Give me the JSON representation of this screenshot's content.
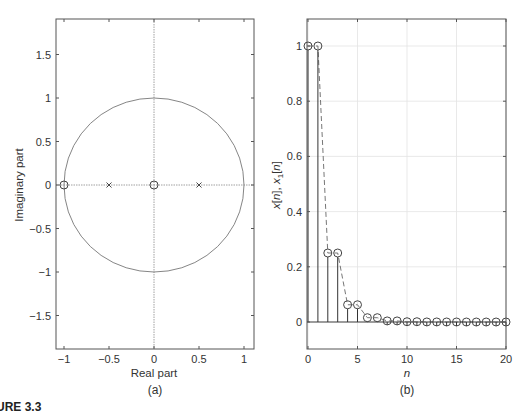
{
  "figure_caption": "URE 3.3",
  "chart_data": [
    {
      "type": "scatter",
      "panel": "(a)",
      "title": "",
      "xlabel": "Real part",
      "ylabel": "Imaginary part",
      "xlim": [
        -1.1,
        1.1
      ],
      "ylim": [
        -1.9,
        1.9
      ],
      "xticks": [
        "-1",
        "-0.5",
        "0",
        "0.5",
        "1"
      ],
      "yticks": [
        "-1.5",
        "-1",
        "-0.5",
        "0",
        "0.5",
        "1",
        "1.5"
      ],
      "grid": false,
      "unit_circle": true,
      "zeros": [
        {
          "re": -1,
          "im": 0
        },
        {
          "re": 0,
          "im": 0
        }
      ],
      "poles": [
        {
          "re": -0.5,
          "im": 0
        },
        {
          "re": 0.5,
          "im": 0
        }
      ],
      "legend": []
    },
    {
      "type": "stem",
      "panel": "(b)",
      "title": "",
      "xlabel": "n",
      "ylabel": "x[n], x1[n]",
      "xlim": [
        0,
        20
      ],
      "ylim": [
        -0.1,
        1.1
      ],
      "xticks": [
        "0",
        "5",
        "10",
        "15",
        "20"
      ],
      "yticks": [
        "0",
        "0.2",
        "0.4",
        "0.6",
        "0.8",
        "1"
      ],
      "grid": true,
      "x": [
        0,
        1,
        2,
        3,
        4,
        5,
        6,
        7,
        8,
        9,
        10,
        11,
        12,
        13,
        14,
        15,
        16,
        17,
        18,
        19,
        20
      ],
      "series": [
        {
          "name": "x[n] (stem)",
          "values": [
            1,
            1,
            0.25,
            0.25,
            0.0625,
            0.0625,
            0.0156,
            0.0156,
            0.0039,
            0.0039,
            0.001,
            0.001,
            0.0002,
            0.0002,
            0.0001,
            0.0001,
            0,
            0,
            0,
            0,
            0
          ]
        },
        {
          "name": "x1[n] (dashed envelope)",
          "values": [
            1,
            1,
            0.25,
            0.25,
            0.0625,
            0.0625,
            0.0156,
            0.0156,
            0.0039,
            0.0039,
            0.001,
            0.001,
            0.0002,
            0.0002,
            0.0001,
            0.0001,
            0,
            0,
            0,
            0,
            0
          ]
        }
      ],
      "legend": []
    }
  ]
}
